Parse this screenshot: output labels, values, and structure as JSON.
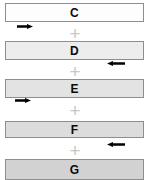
{
  "figure": {
    "type": "stacked-band-diagram",
    "background_color": "#ffffff",
    "width": 152,
    "height": 180
  },
  "bars": [
    {
      "label": "C",
      "fill_color": "#fdfdfd",
      "border_color": "#8e8e8e",
      "x": 5,
      "y": 3,
      "width": 139,
      "height": 19
    },
    {
      "label": "D",
      "fill_color": "#ededed",
      "border_color": "#8e8e8e",
      "x": 5,
      "y": 41,
      "width": 139,
      "height": 19
    },
    {
      "label": "E",
      "fill_color": "#e3e3e3",
      "border_color": "#8e8e8e",
      "x": 5,
      "y": 79,
      "width": 139,
      "height": 19
    },
    {
      "label": "F",
      "fill_color": "#dcdcdc",
      "border_color": "#8e8e8e",
      "x": 5,
      "y": 121,
      "width": 139,
      "height": 17
    },
    {
      "label": "G",
      "fill_color": "#d2d2d2",
      "border_color": "#8e8e8e",
      "x": 5,
      "y": 159,
      "width": 139,
      "height": 21
    }
  ],
  "plus_signs": [
    {
      "symbol": "+",
      "x": 67,
      "y": 24
    },
    {
      "symbol": "+",
      "x": 67,
      "y": 62
    },
    {
      "symbol": "+",
      "x": 67,
      "y": 101
    },
    {
      "symbol": "+",
      "x": 67,
      "y": 141
    }
  ],
  "arrows": [
    {
      "direction": "right",
      "color": "#000000",
      "x": 17,
      "y": 24,
      "width": 16,
      "belongs_to": "C"
    },
    {
      "direction": "left",
      "color": "#000000",
      "x": 107,
      "y": 61,
      "width": 18,
      "belongs_to": "D"
    },
    {
      "direction": "right",
      "color": "#000000",
      "x": 15,
      "y": 98,
      "width": 16,
      "belongs_to": "E"
    },
    {
      "direction": "left",
      "color": "#000000",
      "x": 107,
      "y": 142,
      "width": 18,
      "belongs_to": "F"
    }
  ]
}
